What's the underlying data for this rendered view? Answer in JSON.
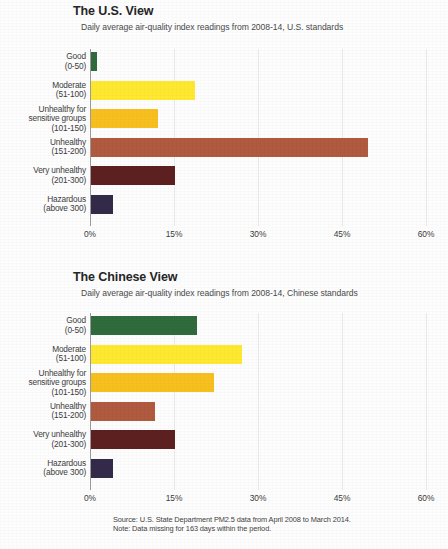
{
  "figure": {
    "source_line": "Source: U.S. State Department PM2.5 data from April 2008 to March 2014.",
    "note_line": "Note: Data missing for 163 days within the period."
  },
  "categories": [
    {
      "name": "Good",
      "range": "(0-50)"
    },
    {
      "name": "Moderate",
      "range": "(51-100)"
    },
    {
      "name": "Unhealthy for",
      "name2": "sensitive groups",
      "range": "(101-150)"
    },
    {
      "name": "Unhealthy",
      "range": "(151-200)"
    },
    {
      "name": "Very unhealthy",
      "range": "(201-300)"
    },
    {
      "name": "Hazardous",
      "range": "(above 300)"
    }
  ],
  "colors": {
    "good": "#2f6b3c",
    "moderate": "#ffe930",
    "sensitive": "#f8c01f",
    "unhealthy": "#b05a3f",
    "very_unhealthy": "#5d2020",
    "hazardous": "#332a4a",
    "axis": "#9a9a9a",
    "grid": "#e9e9e9"
  },
  "ticks": [
    "0%",
    "15%",
    "30%",
    "45%",
    "60%"
  ],
  "chart_data": [
    {
      "type": "bar",
      "orientation": "horizontal",
      "title": "The U.S. View",
      "subtitle": "Daily average air-quality index readings from 2008-14, U.S. standards",
      "xlabel": "",
      "ylabel": "",
      "xlim": [
        0,
        60
      ],
      "xticks": [
        0,
        15,
        30,
        45,
        60
      ],
      "xtick_labels": [
        "0%",
        "15%",
        "30%",
        "45%",
        "60%"
      ],
      "grid": true,
      "legend": false,
      "categories": [
        "Good (0-50)",
        "Moderate (51-100)",
        "Unhealthy for sensitive groups (101-150)",
        "Unhealthy (151-200)",
        "Very unhealthy (201-300)",
        "Hazardous (above 300)"
      ],
      "values": [
        1.0,
        18.5,
        12.0,
        49.5,
        15.0,
        4.0
      ],
      "bar_colors": [
        "#2f6b3c",
        "#ffe930",
        "#f8c01f",
        "#b05a3f",
        "#5d2020",
        "#332a4a"
      ]
    },
    {
      "type": "bar",
      "orientation": "horizontal",
      "title": "The Chinese View",
      "subtitle": "Daily average air-quality index readings from 2008-14, Chinese standards",
      "xlabel": "",
      "ylabel": "",
      "xlim": [
        0,
        60
      ],
      "xticks": [
        0,
        15,
        30,
        45,
        60
      ],
      "xtick_labels": [
        "0%",
        "15%",
        "30%",
        "45%",
        "60%"
      ],
      "grid": true,
      "legend": false,
      "categories": [
        "Good (0-50)",
        "Moderate (51-100)",
        "Unhealthy for sensitive groups (101-150)",
        "Unhealthy (151-200)",
        "Very unhealthy (201-300)",
        "Hazardous (above 300)"
      ],
      "values": [
        19.0,
        27.0,
        22.0,
        11.5,
        15.0,
        4.0
      ],
      "bar_colors": [
        "#2f6b3c",
        "#ffe930",
        "#f8c01f",
        "#b05a3f",
        "#5d2020",
        "#332a4a"
      ]
    }
  ]
}
